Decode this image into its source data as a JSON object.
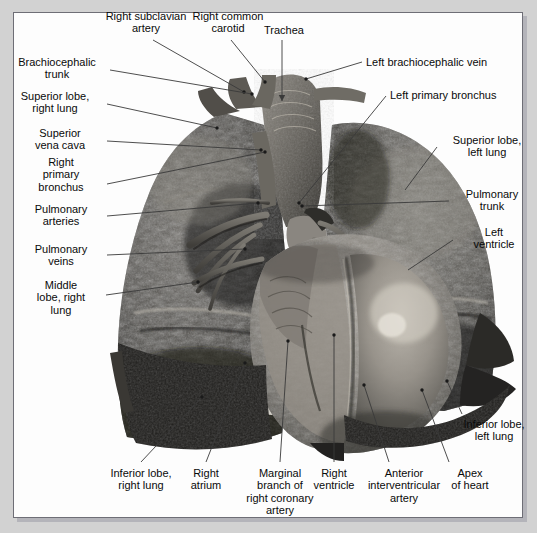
{
  "figure": {
    "kind": "anatomical-photograph",
    "frame_color": "#6e6e76",
    "page_background": "#d2d2d2",
    "plate_background": "#ffffff",
    "leader_color": "#3a3a3a"
  },
  "labels": [
    {
      "id": "right-subclavian-artery",
      "text": "Right subclavian\nartery",
      "align": "center",
      "x": 86,
      "y": 10,
      "w": 120
    },
    {
      "id": "right-common-carotid",
      "text": "Right common\ncarotid",
      "align": "center",
      "x": 176,
      "y": 10,
      "w": 104
    },
    {
      "id": "trachea",
      "text": "Trachea",
      "align": "center",
      "x": 253,
      "y": 24,
      "w": 62
    },
    {
      "id": "left-brachiocephalic-vein",
      "text": "Left brachiocephalic vein",
      "align": "left",
      "x": 366,
      "y": 56,
      "w": 160
    },
    {
      "id": "brachiocephalic-trunk",
      "text": "Brachiocephalic\ntrunk",
      "align": "center",
      "x": 6,
      "y": 56,
      "w": 102
    },
    {
      "id": "left-primary-bronchus",
      "text": "Left primary bronchus",
      "align": "left",
      "x": 390,
      "y": 89,
      "w": 140
    },
    {
      "id": "superior-lobe-right-lung",
      "text": "Superior lobe,\nright lung",
      "align": "center",
      "x": 5,
      "y": 90,
      "w": 100
    },
    {
      "id": "superior-vena-cava",
      "text": "Superior\nvena cava",
      "align": "center",
      "x": 16,
      "y": 127,
      "w": 88
    },
    {
      "id": "superior-lobe-left-lung",
      "text": "Superior lobe,\nleft lung",
      "align": "center",
      "x": 440,
      "y": 134,
      "w": 94
    },
    {
      "id": "right-primary-bronchus",
      "text": "Right\nprimary\nbronchus",
      "align": "center",
      "x": 19,
      "y": 156,
      "w": 84
    },
    {
      "id": "pulmonary-trunk",
      "text": "Pulmonary\ntrunk",
      "align": "center",
      "x": 452,
      "y": 188,
      "w": 80
    },
    {
      "id": "pulmonary-arteries",
      "text": "Pulmonary\narteries",
      "align": "center",
      "x": 18,
      "y": 203,
      "w": 86
    },
    {
      "id": "left-ventricle",
      "text": "Left\nventricle",
      "align": "center",
      "x": 456,
      "y": 226,
      "w": 76
    },
    {
      "id": "pulmonary-veins",
      "text": "Pulmonary\nveins",
      "align": "center",
      "x": 18,
      "y": 243,
      "w": 86
    },
    {
      "id": "middle-lobe-right-lung",
      "text": "Middle\nlobe, right\nlung",
      "align": "center",
      "x": 20,
      "y": 279,
      "w": 82
    },
    {
      "id": "inferior-lobe-left-lung",
      "text": "Inferior lobe,\nleft lung",
      "align": "center",
      "x": 452,
      "y": 418,
      "w": 84
    },
    {
      "id": "inferior-lobe-right-lung",
      "text": "Inferior lobe,\nright lung",
      "align": "center",
      "x": 93,
      "y": 467,
      "w": 96
    },
    {
      "id": "right-atrium",
      "text": "Right\natrium",
      "align": "center",
      "x": 178,
      "y": 467,
      "w": 56
    },
    {
      "id": "marginal-branch-right-coronary",
      "text": "Marginal\nbranch of\nright coronary\nartery",
      "align": "center",
      "x": 234,
      "y": 467,
      "w": 92
    },
    {
      "id": "right-ventricle",
      "text": "Right\nventricle",
      "align": "center",
      "x": 302,
      "y": 467,
      "w": 64
    },
    {
      "id": "anterior-interventricular-artery",
      "text": "Anterior\ninterventricular\nartery",
      "align": "center",
      "x": 358,
      "y": 467,
      "w": 92
    },
    {
      "id": "apex-of-heart",
      "text": "Apex\nof heart",
      "align": "center",
      "x": 440,
      "y": 467,
      "w": 60
    }
  ],
  "leaders": [
    {
      "id": "right-subclavian-artery",
      "x1": 153,
      "y1": 40,
      "x2": 244,
      "y2": 92,
      "dot": true
    },
    {
      "id": "right-common-carotid",
      "x1": 231,
      "y1": 40,
      "x2": 265,
      "y2": 82,
      "dot": true
    },
    {
      "id": "trachea",
      "x1": 282,
      "y1": 40,
      "x2": 282,
      "y2": 101,
      "dot": false,
      "arrow": true
    },
    {
      "id": "left-brachiocephalic-vein",
      "x1": 362,
      "y1": 62,
      "x2": 306,
      "y2": 79,
      "dot": true
    },
    {
      "id": "brachiocephalic-trunk",
      "x1": 110,
      "y1": 70,
      "x2": 252,
      "y2": 94,
      "dot": true
    },
    {
      "id": "left-primary-bronchus",
      "x1": 386,
      "y1": 96,
      "x2": 299,
      "y2": 203,
      "dot": true
    },
    {
      "id": "superior-lobe-right-lung",
      "x1": 107,
      "y1": 104,
      "x2": 217,
      "y2": 128,
      "dot": true
    },
    {
      "id": "superior-vena-cava",
      "x1": 107,
      "y1": 141,
      "x2": 261,
      "y2": 150,
      "dot": true
    },
    {
      "id": "superior-lobe-left-lung",
      "x1": 437,
      "y1": 147,
      "x2": 405,
      "y2": 190,
      "dot": false
    },
    {
      "id": "right-primary-bronchus",
      "x1": 107,
      "y1": 184,
      "x2": 265,
      "y2": 152,
      "dot": true
    },
    {
      "id": "pulmonary-trunk",
      "x1": 449,
      "y1": 201,
      "x2": 302,
      "y2": 206,
      "dot": true
    },
    {
      "id": "pulmonary-arteries",
      "x1": 107,
      "y1": 216,
      "x2": 258,
      "y2": 203,
      "dot": true
    },
    {
      "id": "left-ventricle",
      "x1": 453,
      "y1": 240,
      "x2": 408,
      "y2": 270,
      "dot": false
    },
    {
      "id": "pulmonary-veins",
      "x1": 107,
      "y1": 255,
      "x2": 245,
      "y2": 249,
      "dot": true
    },
    {
      "id": "middle-lobe-right-lung",
      "x1": 106,
      "y1": 295,
      "x2": 198,
      "y2": 282,
      "dot": true
    },
    {
      "id": "inferior-lobe-left-lung",
      "x1": 462,
      "y1": 414,
      "x2": 447,
      "y2": 381,
      "dot": true
    },
    {
      "id": "inferior-lobe-right-lung",
      "x1": 141,
      "y1": 462,
      "x2": 202,
      "y2": 397,
      "dot": true
    },
    {
      "id": "right-atrium",
      "x1": 206,
      "y1": 462,
      "x2": 245,
      "y2": 363,
      "dot": true
    },
    {
      "id": "marginal-branch-right-coronary",
      "x1": 280,
      "y1": 462,
      "x2": 288,
      "y2": 341,
      "dot": true
    },
    {
      "id": "right-ventricle",
      "x1": 334,
      "y1": 462,
      "x2": 334,
      "y2": 335,
      "dot": true
    },
    {
      "id": "anterior-interventricular-artery",
      "x1": 389,
      "y1": 462,
      "x2": 364,
      "y2": 385,
      "dot": true
    },
    {
      "id": "apex-of-heart",
      "x1": 449,
      "y1": 462,
      "x2": 422,
      "y2": 390,
      "dot": true
    },
    {
      "id": "left-ventricle-inner",
      "x1": 475,
      "y1": 253,
      "x2": 372,
      "y2": 472,
      "dot": true,
      "hidden": true
    }
  ]
}
